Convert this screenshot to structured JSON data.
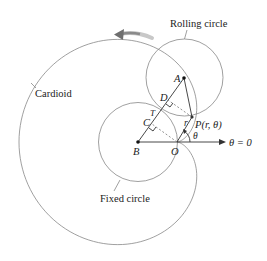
{
  "diagram": {
    "labels": {
      "rolling_circle": "Rolling circle",
      "cardioid": "Cardioid",
      "fixed_circle": "Fixed circle",
      "polar_axis": "θ = 0"
    },
    "points": {
      "A": "A",
      "B": "B",
      "C": "C",
      "D": "D",
      "O": "O",
      "T": "T",
      "P": "P(r, θ)",
      "r": "r",
      "theta": "θ"
    },
    "geometry": {
      "B": [
        138,
        142
      ],
      "O": [
        177,
        142
      ],
      "A": [
        184,
        78
      ],
      "P": [
        192,
        117
      ],
      "radius": 39.5
    },
    "colors": {
      "curve": "#8a8a8a",
      "line": "#333333",
      "arrow": "#7a7a7a"
    }
  }
}
